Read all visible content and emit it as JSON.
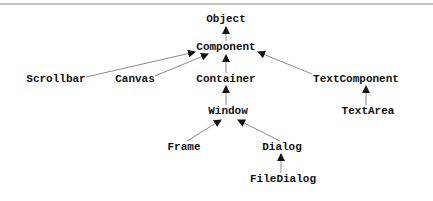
{
  "diagram": {
    "type": "class-hierarchy",
    "nodes": [
      {
        "id": "object",
        "label": "Object",
        "x": 226,
        "y": 19
      },
      {
        "id": "component",
        "label": "Component",
        "x": 226,
        "y": 47
      },
      {
        "id": "scrollbar",
        "label": "Scrollbar",
        "x": 56,
        "y": 79
      },
      {
        "id": "canvas",
        "label": "Canvas",
        "x": 135,
        "y": 79
      },
      {
        "id": "container",
        "label": "Container",
        "x": 226,
        "y": 79
      },
      {
        "id": "textcomponent",
        "label": "TextComponent",
        "x": 356,
        "y": 79
      },
      {
        "id": "window",
        "label": "Window",
        "x": 228,
        "y": 111
      },
      {
        "id": "textarea",
        "label": "TextArea",
        "x": 368,
        "y": 111
      },
      {
        "id": "frame",
        "label": "Frame",
        "x": 184,
        "y": 147
      },
      {
        "id": "dialog",
        "label": "Dialog",
        "x": 282,
        "y": 147
      },
      {
        "id": "filedialog",
        "label": "FileDialog",
        "x": 283,
        "y": 179
      }
    ],
    "edges": [
      {
        "from": "component",
        "to": "object"
      },
      {
        "from": "scrollbar",
        "to": "component"
      },
      {
        "from": "canvas",
        "to": "component"
      },
      {
        "from": "container",
        "to": "component"
      },
      {
        "from": "textcomponent",
        "to": "component"
      },
      {
        "from": "window",
        "to": "container"
      },
      {
        "from": "textarea",
        "to": "textcomponent"
      },
      {
        "from": "frame",
        "to": "window"
      },
      {
        "from": "dialog",
        "to": "window"
      },
      {
        "from": "filedialog",
        "to": "dialog"
      }
    ]
  },
  "labels": {
    "object": "Object",
    "component": "Component",
    "scrollbar": "Scrollbar",
    "canvas": "Canvas",
    "container": "Container",
    "textcomponent": "TextComponent",
    "window": "Window",
    "textarea": "TextArea",
    "frame": "Frame",
    "dialog": "Dialog",
    "filedialog": "FileDialog"
  },
  "colors": {
    "line": "#8a8a8a",
    "arrow": "#111111",
    "text": "#111111",
    "rule": "#c4c4c4"
  }
}
